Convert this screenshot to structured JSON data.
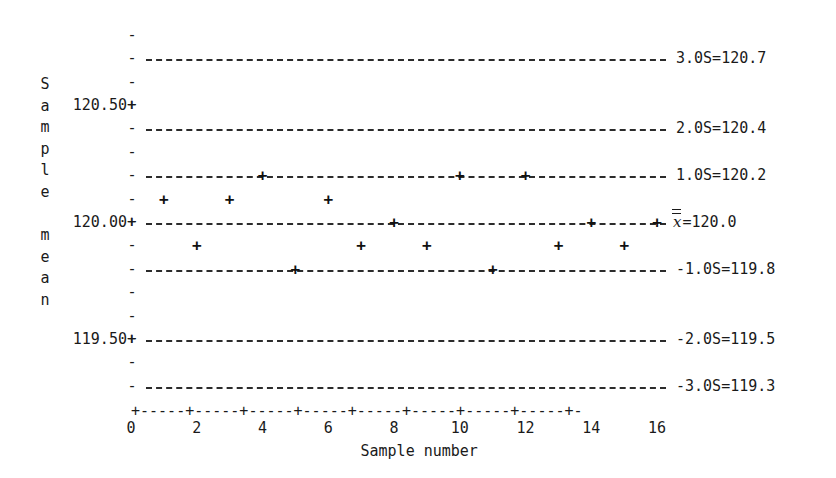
{
  "chart_data": {
    "type": "scatter",
    "title": "",
    "xlabel": "Sample number",
    "ylabel": "Sample mean",
    "xlim": [
      0,
      17
    ],
    "ylim": [
      119.25,
      120.85
    ],
    "grid": false,
    "legend": "none",
    "x": [
      1,
      2,
      3,
      4,
      5,
      6,
      7,
      8,
      9,
      10,
      11,
      12,
      13,
      14,
      15,
      16
    ],
    "values": [
      120.1,
      119.9,
      120.1,
      120.2,
      119.8,
      120.1,
      119.9,
      120.0,
      119.9,
      120.2,
      119.8,
      120.2,
      119.9,
      120.0,
      119.9,
      120.0
    ],
    "xticks": [
      0,
      2,
      4,
      6,
      8,
      10,
      12,
      14,
      16
    ],
    "xticklabels": [
      "0",
      "2",
      "4",
      "6",
      "8",
      "10",
      "12",
      "14",
      "16"
    ],
    "yticks": [
      120.5,
      120.0,
      119.5
    ],
    "yticklabels": [
      "120.50",
      "120.00",
      "119.50"
    ],
    "control_limits": [
      {
        "name": "plus-3-sigma",
        "label": "3.0S=120.7",
        "value": 120.7
      },
      {
        "name": "plus-2-sigma",
        "label": "2.0S=120.4",
        "value": 120.4
      },
      {
        "name": "plus-1-sigma",
        "label": "1.0S=120.2",
        "value": 120.2
      },
      {
        "name": "center-line",
        "label": "=120.0",
        "value": 120.0,
        "symbol": "x"
      },
      {
        "name": "minus-1-sigma",
        "label": "-1.0S=119.8",
        "value": 119.8
      },
      {
        "name": "minus-2-sigma",
        "label": "-2.0S=119.5",
        "value": 119.5
      },
      {
        "name": "minus-3-sigma",
        "label": "-3.0S=119.3",
        "value": 119.3
      }
    ]
  },
  "axes": {
    "y_title": "Sample\nmean",
    "y_title_chars": [
      "S",
      "a",
      "m",
      "p",
      "l",
      "e",
      "",
      "m",
      "e",
      "a",
      "n"
    ],
    "y_labels": [
      {
        "text": "120.50+",
        "value": 120.5
      },
      {
        "text": "120.00+",
        "value": 120.0
      },
      {
        "text": "119.50+",
        "value": 119.5
      }
    ],
    "tick_glyph_minor": "-",
    "tick_glyph_major": "+",
    "x_axis_line": "+-----+-----+-----+-----+-----+-----+-----+-----+-",
    "x_tick_labels": [
      "0",
      "2",
      "4",
      "6",
      "8",
      "10",
      "12",
      "14",
      "16"
    ],
    "x_title": "Sample number"
  },
  "style": {
    "background": "#ffffff",
    "ink": "#1a1a1a",
    "line": "#2b2b2b",
    "marker": "#111111"
  }
}
